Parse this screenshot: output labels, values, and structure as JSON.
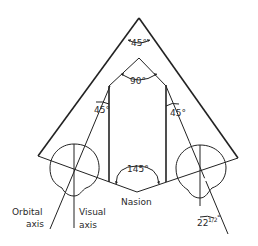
{
  "diagram": {
    "angles": {
      "apex": "45°",
      "inner_apex": "90°",
      "left_orbit": "45°",
      "right_orbit": "45°",
      "nasion": "145°",
      "axis_divergence_whole": "22",
      "axis_divergence_fraction": "1/2",
      "axis_divergence_degree": "°"
    },
    "labels": {
      "nasion": "Nasion",
      "orbital_axis_line1": "Orbital",
      "orbital_axis_line2": "axis",
      "visual_axis_line1": "Visual",
      "visual_axis_line2": "axis"
    },
    "colors": {
      "line": "#222222",
      "background": "#ffffff"
    }
  }
}
